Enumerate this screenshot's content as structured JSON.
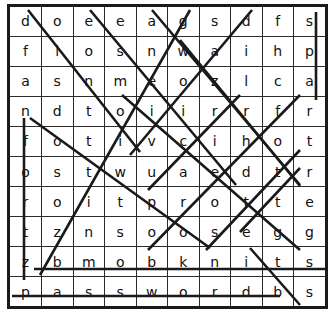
{
  "puzzle": {
    "title": "word-search-grid",
    "rows": 10,
    "cols": 10,
    "grid": [
      [
        "d",
        "o",
        "e",
        "e",
        "a",
        "g",
        "s",
        "d",
        "f",
        "s"
      ],
      [
        "f",
        "i",
        "o",
        "s",
        "n",
        "w",
        "a",
        "i",
        "h",
        "p"
      ],
      [
        "a",
        "s",
        "n",
        "m",
        "e",
        "o",
        "z",
        "l",
        "c",
        "a"
      ],
      [
        "n",
        "d",
        "t",
        "o",
        "i",
        "i",
        "r",
        "r",
        "f",
        "r"
      ],
      [
        "f",
        "o",
        "t",
        "i",
        "v",
        "c",
        "i",
        "h",
        "o",
        "t"
      ],
      [
        "o",
        "s",
        "t",
        "w",
        "u",
        "a",
        "e",
        "d",
        "t",
        "r"
      ],
      [
        "r",
        "o",
        "i",
        "t",
        "p",
        "r",
        "o",
        "t",
        "t",
        "e"
      ],
      [
        "t",
        "z",
        "n",
        "s",
        "o",
        "o",
        "s",
        "e",
        "g",
        "g"
      ],
      [
        "z",
        "b",
        "m",
        "o",
        "b",
        "k",
        "n",
        "i",
        "t",
        "s"
      ],
      [
        "p",
        "a",
        "s",
        "s",
        "w",
        "o",
        "r",
        "d",
        "b",
        "s"
      ]
    ],
    "colors": {
      "grid_line": "#2b2b2b",
      "border": "#1a1a1a",
      "letter": "#111111",
      "strike": "#1a1a1a",
      "background": "#ffffff"
    },
    "strikes": [
      {
        "name": "strike-diag-1",
        "x1": 28,
        "y1": 10,
        "x2": 140,
        "y2": 152
      },
      {
        "name": "strike-diag-2",
        "x1": 90,
        "y1": 10,
        "x2": 236,
        "y2": 185
      },
      {
        "name": "strike-diag-3",
        "x1": 152,
        "y1": 10,
        "x2": 300,
        "y2": 185
      },
      {
        "name": "strike-diag-4",
        "x1": 190,
        "y1": 10,
        "x2": 40,
        "y2": 275
      },
      {
        "name": "strike-diag-5",
        "x1": 252,
        "y1": 10,
        "x2": 130,
        "y2": 155
      },
      {
        "name": "strike-diag-6",
        "x1": 180,
        "y1": 40,
        "x2": 300,
        "y2": 186
      },
      {
        "name": "strike-diag-7",
        "x1": 30,
        "y1": 118,
        "x2": 210,
        "y2": 248
      },
      {
        "name": "strike-diag-8",
        "x1": 122,
        "y1": 95,
        "x2": 300,
        "y2": 250
      },
      {
        "name": "strike-diag-9",
        "x1": 300,
        "y1": 95,
        "x2": 148,
        "y2": 250
      },
      {
        "name": "strike-diag-10",
        "x1": 240,
        "y1": 95,
        "x2": 148,
        "y2": 190
      },
      {
        "name": "strike-diag-11",
        "x1": 300,
        "y1": 150,
        "x2": 206,
        "y2": 250
      },
      {
        "name": "strike-diag-12",
        "x1": 240,
        "y1": 232,
        "x2": 300,
        "y2": 168
      },
      {
        "name": "strike-vert-f",
        "x1": 24,
        "y1": 118,
        "x2": 24,
        "y2": 280
      },
      {
        "name": "strike-vert-s",
        "x1": 316,
        "y1": 12,
        "x2": 316,
        "y2": 100
      },
      {
        "name": "strike-horiz-row9",
        "x1": 34,
        "y1": 269,
        "x2": 327,
        "y2": 269
      },
      {
        "name": "strike-horiz-row10",
        "x1": 12,
        "y1": 296,
        "x2": 280,
        "y2": 296
      },
      {
        "name": "strike-diag-13",
        "x1": 250,
        "y1": 248,
        "x2": 300,
        "y2": 305
      }
    ]
  }
}
